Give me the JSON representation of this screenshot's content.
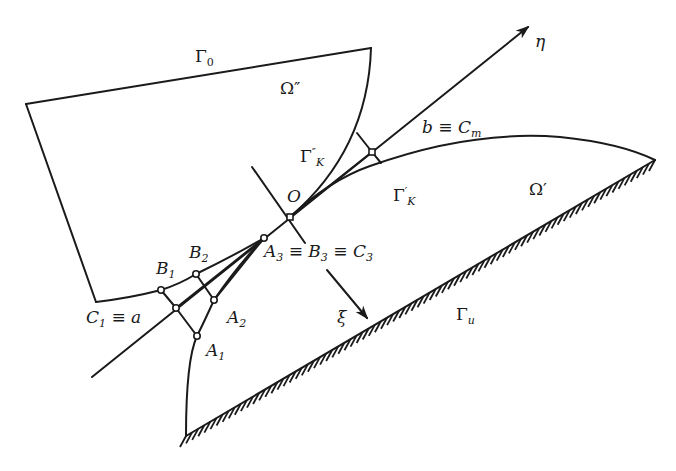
{
  "colors": {
    "ink": "#1a1a1a",
    "background": "#ffffff"
  },
  "labels": {
    "gamma0": {
      "base": "Γ",
      "sub": "0"
    },
    "omega_dd": {
      "base": "Ω",
      "sup": "″"
    },
    "gammaK_dd": {
      "base": "Γ",
      "sup": "″",
      "sub": "K"
    },
    "origin": "O",
    "eta": "η",
    "b_cm": {
      "base": "b ≡ C",
      "sub": "m"
    },
    "gammaK_d": {
      "base": "Γ",
      "sup": "′",
      "sub": "K"
    },
    "omega_d": {
      "base": "Ω",
      "sup": "′"
    },
    "a3": {
      "a": "A",
      "a_sub": "3",
      "mid1": " ≡ B",
      "b_sub": "3",
      "mid2": " ≡ C",
      "c_sub": "3"
    },
    "b1": {
      "base": "B",
      "sub": "1"
    },
    "b2": {
      "base": "B",
      "sub": "2"
    },
    "a1": {
      "base": "A",
      "sub": "1"
    },
    "a2": {
      "base": "A",
      "sub": "2"
    },
    "c1": {
      "base": "C",
      "sub": "1",
      "rest": " ≡ a"
    },
    "xi": "ξ",
    "gamma_u": {
      "base": "Γ",
      "sub": "u"
    }
  }
}
